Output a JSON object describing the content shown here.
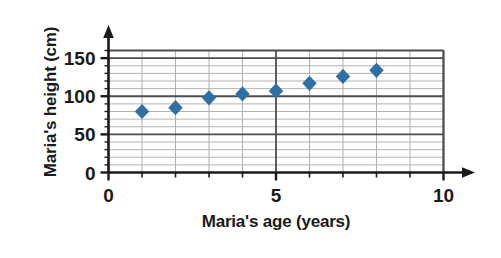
{
  "chart_data": {
    "type": "scatter",
    "title": "",
    "xlabel": "Maria's age (years)",
    "ylabel": "Maria's height (cm)",
    "x": [
      1,
      2,
      3,
      4,
      5,
      6,
      7,
      8
    ],
    "values": [
      80,
      85,
      98,
      103,
      107,
      117,
      126,
      134
    ],
    "points": [
      {
        "x": 1,
        "y": 80
      },
      {
        "x": 2,
        "y": 85
      },
      {
        "x": 3,
        "y": 98
      },
      {
        "x": 4,
        "y": 103
      },
      {
        "x": 5,
        "y": 107
      },
      {
        "x": 6,
        "y": 117
      },
      {
        "x": 7,
        "y": 126
      },
      {
        "x": 8,
        "y": 134
      }
    ],
    "xlim": [
      0,
      10
    ],
    "ylim": [
      0,
      160
    ],
    "xticks": [
      0,
      5,
      10
    ],
    "xticklabels": [
      "0",
      "5",
      "10"
    ],
    "xminor_ticks": [
      1,
      2,
      3,
      4,
      6,
      7,
      8,
      9
    ],
    "yticks": [
      0,
      50,
      100,
      150
    ],
    "yticklabels": [
      "0",
      "50",
      "100",
      "150"
    ],
    "yminor_step": 10,
    "grid": true,
    "grid_major_color": "#4d4d4d",
    "grid_minor_color": "#b3b3b3",
    "axis_color": "#1a1a1a",
    "marker": "diamond",
    "marker_color": "#2f6fa3",
    "legend": null,
    "legend_position": "none"
  },
  "axis_titles": {
    "x": "Maria's age (years)",
    "y": "Maria's height (cm)"
  }
}
